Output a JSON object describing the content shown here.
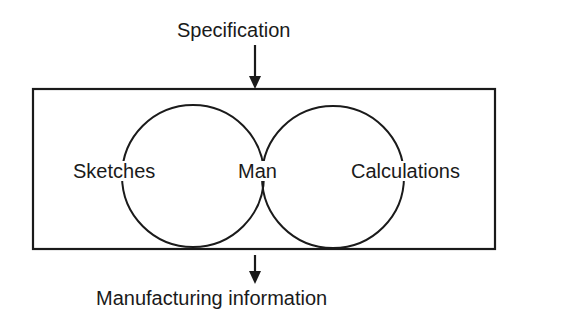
{
  "diagram": {
    "input_label": "Specification",
    "output_label": "Manufacturing information",
    "nodes": {
      "left": "Sketches",
      "center": "Man",
      "right": "Calculations"
    },
    "colors": {
      "line": "#1a1a1a",
      "background": "#ffffff"
    }
  }
}
